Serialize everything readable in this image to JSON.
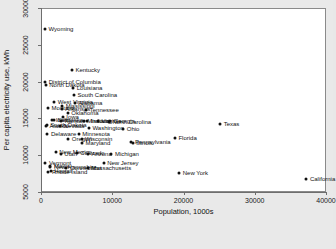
{
  "chart_data": {
    "type": "scatter",
    "title": "",
    "xlabel": "Population, 1000s",
    "ylabel": "Per capita electricity use, kWh",
    "xlim": [
      0,
      40000
    ],
    "ylim": [
      5000,
      30000
    ],
    "xticks": [
      0,
      10000,
      20000,
      30000,
      40000
    ],
    "yticks": [
      5000,
      10000,
      15000,
      20000,
      25000,
      30000
    ],
    "xticklabels": [
      "0",
      "10000",
      "20000",
      "30000",
      "40000"
    ],
    "yticklabels": [
      "5000",
      "10000",
      "15000",
      "20000",
      "25000",
      "30000"
    ],
    "grid": false,
    "legend": false,
    "marker_color": "#101010",
    "plot_background": "#ffffff",
    "page_background": "#e9e9e9",
    "points": [
      {
        "label": "Wyoming",
        "x": 560,
        "y": 27200
      },
      {
        "label": "Kentucky",
        "x": 4340,
        "y": 21600
      },
      {
        "label": "District of Columbia",
        "x": 600,
        "y": 19900
      },
      {
        "label": "North Dakota",
        "x": 670,
        "y": 19500
      },
      {
        "label": "Louisiana",
        "x": 4530,
        "y": 19100
      },
      {
        "label": "South Carolina",
        "x": 4630,
        "y": 18200
      },
      {
        "label": "West Virginia",
        "x": 1850,
        "y": 17200
      },
      {
        "label": "Alabama",
        "x": 4780,
        "y": 17100
      },
      {
        "label": "Mississippi",
        "x": 2970,
        "y": 16700
      },
      {
        "label": "Montana",
        "x": 990,
        "y": 16400
      },
      {
        "label": "Arkansas",
        "x": 2920,
        "y": 16300
      },
      {
        "label": "Tennessee",
        "x": 6350,
        "y": 16200
      },
      {
        "label": "Oklahoma",
        "x": 3750,
        "y": 15700
      },
      {
        "label": "Iowa",
        "x": 3050,
        "y": 15200
      },
      {
        "label": "Idaho",
        "x": 1570,
        "y": 14800
      },
      {
        "label": "Nebraska",
        "x": 1830,
        "y": 14800
      },
      {
        "label": "Kansas",
        "x": 2850,
        "y": 14700
      },
      {
        "label": "Missouri",
        "x": 5990,
        "y": 14700
      },
      {
        "label": "Indiana",
        "x": 6480,
        "y": 14700
      },
      {
        "label": "Virginia",
        "x": 8000,
        "y": 14600
      },
      {
        "label": "Georgia",
        "x": 9690,
        "y": 14600
      },
      {
        "label": "North Carolina",
        "x": 9540,
        "y": 14500
      },
      {
        "label": "South Dakota",
        "x": 820,
        "y": 14100
      },
      {
        "label": "Alaska",
        "x": 710,
        "y": 14000
      },
      {
        "label": "Nevada",
        "x": 2700,
        "y": 14000
      },
      {
        "label": "Texas",
        "x": 25150,
        "y": 14300
      },
      {
        "label": "Washington",
        "x": 6720,
        "y": 13700
      },
      {
        "label": "Ohio",
        "x": 11540,
        "y": 13600
      },
      {
        "label": "Delaware",
        "x": 900,
        "y": 12900
      },
      {
        "label": "Minnesota",
        "x": 5300,
        "y": 12900
      },
      {
        "label": "Oregon",
        "x": 3830,
        "y": 12200
      },
      {
        "label": "Wisconsin",
        "x": 5690,
        "y": 12200
      },
      {
        "label": "Florida",
        "x": 18800,
        "y": 12400
      },
      {
        "label": "Maryland",
        "x": 5770,
        "y": 11700
      },
      {
        "label": "Pennsylvania",
        "x": 12700,
        "y": 11800
      },
      {
        "label": "Illinois",
        "x": 12870,
        "y": 11600
      },
      {
        "label": "New Mexico",
        "x": 2060,
        "y": 10400
      },
      {
        "label": "Colorado",
        "x": 5030,
        "y": 10300
      },
      {
        "label": "Utah",
        "x": 2780,
        "y": 10100
      },
      {
        "label": "Arizona",
        "x": 6590,
        "y": 10100
      },
      {
        "label": "Michigan",
        "x": 9880,
        "y": 10200
      },
      {
        "label": "Vermont",
        "x": 620,
        "y": 9000
      },
      {
        "label": "New Jersey",
        "x": 8790,
        "y": 9000
      },
      {
        "label": "Maine",
        "x": 1330,
        "y": 8600
      },
      {
        "label": "New Hampshire",
        "x": 1320,
        "y": 8400
      },
      {
        "label": "Connecticut",
        "x": 3570,
        "y": 8300
      },
      {
        "label": "Massachusetts",
        "x": 6550,
        "y": 8200
      },
      {
        "label": "Hawaii",
        "x": 1360,
        "y": 7800
      },
      {
        "label": "Rhode Island",
        "x": 1050,
        "y": 7700
      },
      {
        "label": "New York",
        "x": 19400,
        "y": 7600
      },
      {
        "label": "California",
        "x": 37250,
        "y": 6700
      }
    ]
  }
}
